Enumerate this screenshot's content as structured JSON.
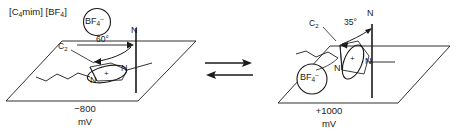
{
  "figure": {
    "compound_label": "[C4mim] [BF4]",
    "compound_parts": {
      "cation_open": "[C",
      "cation_sub": "4",
      "cation_rest": "mim] [BF",
      "anion_sub": "4",
      "close": "]"
    }
  },
  "left_state": {
    "anion_label": "BF4-",
    "anion_text": "BF",
    "anion_sub": "4",
    "anion_charge": "−",
    "angle_label": "60°",
    "normal_axis_label": "N",
    "c2_label": "C2",
    "c2_text": "C",
    "c2_sub": "2",
    "ring_nitrogen_1": "N",
    "ring_nitrogen_2": "N",
    "ring_charge": "+",
    "potential_value": "−800",
    "potential_unit": "mV"
  },
  "right_state": {
    "anion_label": "BF4-",
    "anion_text": "BF",
    "anion_sub": "4",
    "anion_charge": "−",
    "angle_label": "35°",
    "normal_axis_label": "N",
    "c2_label": "C2",
    "c2_text": "C",
    "c2_sub": "2",
    "ring_nitrogen_1": "N",
    "ring_nitrogen_2": "N",
    "ring_charge": "+",
    "potential_value": "+1000",
    "potential_unit": "mV"
  },
  "equilibrium": {
    "forward_arrow": "right-arrow",
    "reverse_arrow": "left-arrow"
  },
  "colors": {
    "stroke": "#1a1a1a",
    "background": "#ffffff"
  }
}
